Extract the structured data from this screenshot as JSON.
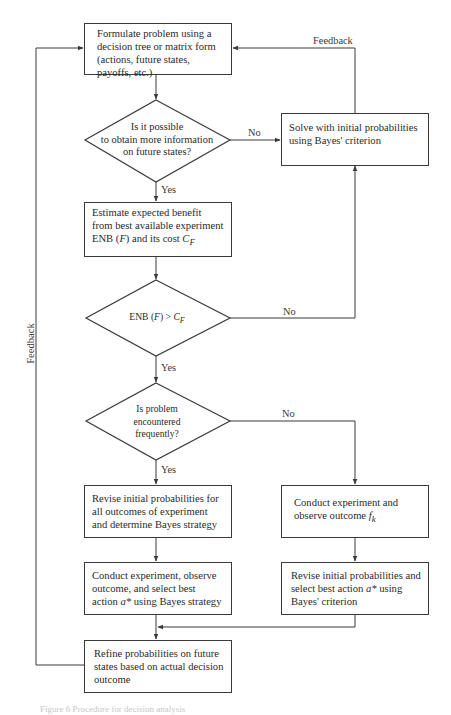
{
  "diagram": {
    "boxes": {
      "formulate": "Formulate problem using a decision tree or matrix form (actions, future states, payoffs, etc.)",
      "solve_initial": "Solve with initial probabilities using Bayes' criterion",
      "estimate_line1": "Estimate expected benefit from best available experiment ENB (",
      "estimate_var": "F",
      "estimate_line2": ") and its cost ",
      "estimate_cost": "C",
      "estimate_cost_sub": "F",
      "revise_all": "Revise initial probabilities for all outcomes of experiment and determine Bayes strategy",
      "conduct_observe_text": "Conduct experiment and observe outcome ",
      "conduct_observe_var": "f",
      "conduct_observe_sub": "k",
      "conduct_select_text1": "Conduct experiment, observe outcome, and select best action ",
      "conduct_select_var": "a*",
      "conduct_select_text2": " using Bayes strategy",
      "revise_select_text1": "Revise initial probabilities and select best action ",
      "revise_select_var": "a*",
      "revise_select_text2": " using Bayes' criterion",
      "refine": "Refine probabilities on future states based on actual decision outcome"
    },
    "decisions": {
      "more_info": [
        "Is it possible",
        "to obtain more information",
        "on future states?"
      ],
      "enb_text": "ENB (",
      "enb_var": "F",
      "enb_mid": ") > ",
      "enb_cost": "C",
      "enb_sub": "F",
      "frequent": [
        "Is problem",
        "encountered",
        "frequently?"
      ]
    },
    "labels": {
      "no": "No",
      "yes": "Yes",
      "feedback": "Feedback"
    },
    "caption": "Figure 6  Procedure for decision analysis",
    "colors": {
      "line": "#3a3a3a",
      "text": "#2a2a2a",
      "background": "#ffffff"
    }
  }
}
